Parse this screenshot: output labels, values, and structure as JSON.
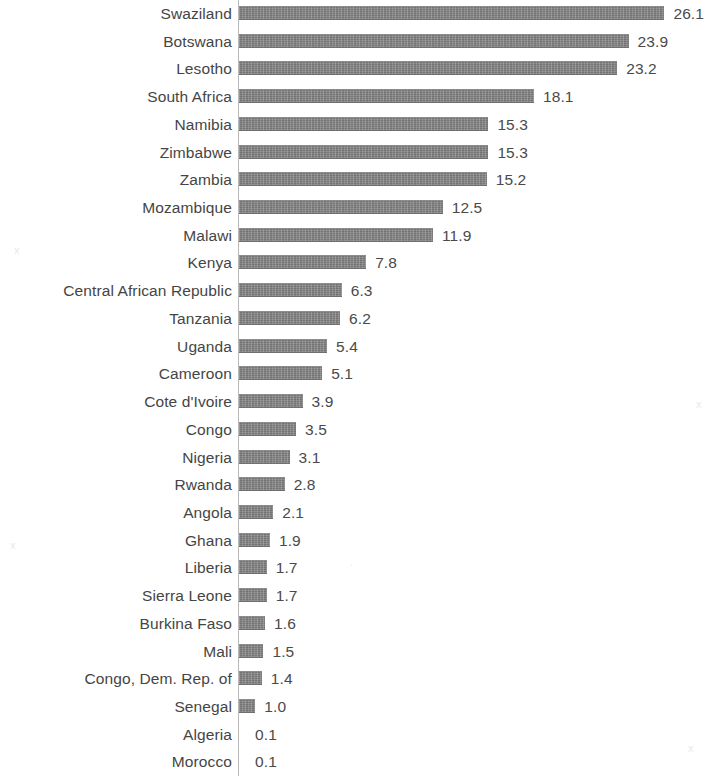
{
  "chart_data": {
    "type": "bar",
    "orientation": "horizontal",
    "title": "",
    "subtitle": "",
    "xlabel": "",
    "ylabel": "",
    "grid": false,
    "legend": null,
    "axis_line": true,
    "xlim": [
      0,
      26.1
    ],
    "value_format": "one-decimal",
    "categories": [
      "Swaziland",
      "Botswana",
      "Lesotho",
      "South Africa",
      "Namibia",
      "Zimbabwe",
      "Zambia",
      "Mozambique",
      "Malawi",
      "Kenya",
      "Central African Republic",
      "Tanzania",
      "Uganda",
      "Cameroon",
      "Cote d'Ivoire",
      "Congo",
      "Nigeria",
      "Rwanda",
      "Angola",
      "Ghana",
      "Liberia",
      "Sierra Leone",
      "Burkina Faso",
      "Mali",
      "Congo, Dem. Rep. of",
      "Senegal",
      "Algeria",
      "Morocco"
    ],
    "values": [
      26.1,
      23.9,
      23.2,
      18.1,
      15.3,
      15.3,
      15.2,
      12.5,
      11.9,
      7.8,
      6.3,
      6.2,
      5.4,
      5.1,
      3.9,
      3.5,
      3.1,
      2.8,
      2.1,
      1.9,
      1.7,
      1.7,
      1.6,
      1.5,
      1.4,
      1.0,
      0.1,
      0.1
    ],
    "value_labels": [
      "26.1",
      "23.9",
      "23.2",
      "18.1",
      "15.3",
      "15.3",
      "15.2",
      "12.5",
      "11.9",
      "7.8",
      "6.3",
      "6.2",
      "5.4",
      "5.1",
      "3.9",
      "3.5",
      "3.1",
      "2.8",
      "2.1",
      "1.9",
      "1.7",
      "1.7",
      "1.6",
      "1.5",
      "1.4",
      "1.0",
      "0.1",
      "0.1"
    ]
  },
  "style": {
    "bar_color": "#808080",
    "axis_color": "#b9b9b9",
    "label_color": "#454545",
    "value_color": "#4a4a4a",
    "background": "#ffffff"
  },
  "geometry": {
    "axis_x": 238,
    "px_per_unit": 16.3,
    "row_pitch": 27.72,
    "first_row_top": 2,
    "bar_height": 14,
    "value_gap": 9,
    "label_right": 232,
    "zero_bar_threshold": 0.2
  },
  "speckles": [
    {
      "x": 14,
      "y": 244,
      "glyph": "x"
    },
    {
      "x": 10,
      "y": 539,
      "glyph": "x"
    },
    {
      "x": 688,
      "y": 742,
      "glyph": "x"
    },
    {
      "x": 696,
      "y": 398,
      "glyph": "x"
    },
    {
      "x": 350,
      "y": 556,
      "glyph": "."
    }
  ]
}
